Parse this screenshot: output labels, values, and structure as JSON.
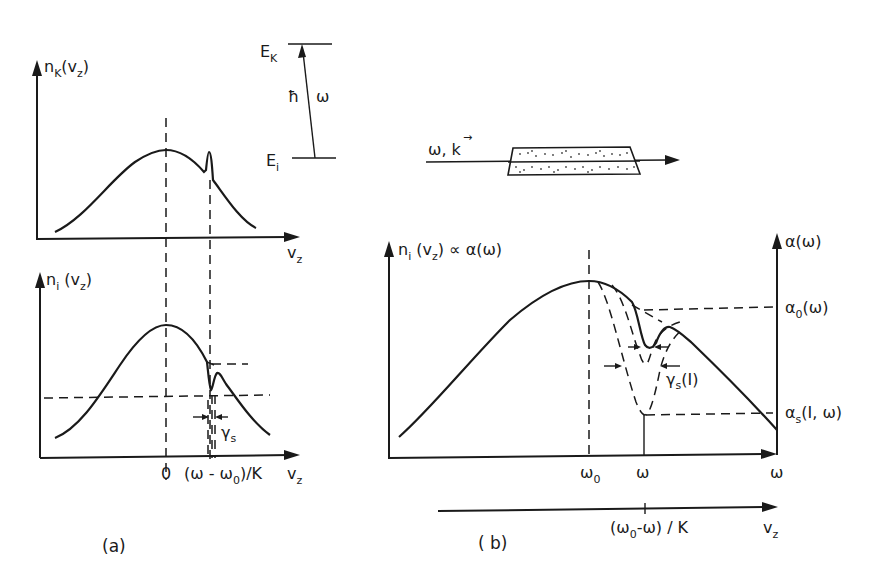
{
  "figure": {
    "panel_a": {
      "caption": "(a)",
      "upper_plot": {
        "y_label": "n",
        "y_label_sub": "K",
        "y_label_arg": "(v",
        "y_label_arg_sub": "z",
        "y_label_close": ")",
        "x_label": "v",
        "x_label_sub": "z"
      },
      "lower_plot": {
        "y_label": "n",
        "y_label_sub": "i",
        "y_label_arg": " (v",
        "y_label_arg_sub": "z",
        "y_label_close": ")",
        "x_label": "v",
        "x_label_sub": "z",
        "tick_zero": "0",
        "tick_resonance": "(ω - ω",
        "tick_resonance_sub": "0",
        "tick_resonance_tail": ")/K",
        "width_label": "γ",
        "width_label_sub": "s"
      },
      "energy_levels": {
        "upper": "E",
        "upper_sub": "K",
        "lower": "E",
        "lower_sub": "i",
        "transition": "ħ",
        "transition_omega": "ω"
      }
    },
    "panel_b": {
      "caption": "( b)",
      "beam_label": "ω, k",
      "beam_vector_arrow": "→",
      "y_label_left": "n",
      "y_label_left_sub": "i",
      "y_label_left_arg": " (v",
      "y_label_left_arg_sub": "z",
      "y_label_left_tail": ") ∝ α(ω)",
      "y_label_right": "α(ω)",
      "alpha0": "α",
      "alpha0_sub": "0",
      "alpha0_tail": "(ω)",
      "alphas": "α",
      "alphas_sub": "s",
      "alphas_tail": "(I, ω)",
      "width_label": "γ",
      "width_label_sub": "s",
      "width_label_tail": "(I)",
      "x_tick_omega0": "ω",
      "x_tick_omega0_sub": "0",
      "x_tick_omega": "ω",
      "x_axis_label": "ω",
      "vz_tick": "(ω",
      "vz_tick_sub": "0",
      "vz_tick_tail": "-ω) / K",
      "vz_axis_label": "v",
      "vz_axis_label_sub": "z"
    }
  }
}
